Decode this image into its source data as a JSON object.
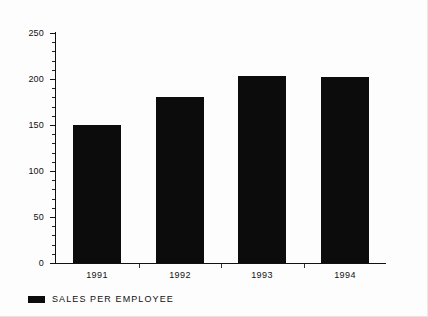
{
  "chart_data": {
    "type": "bar",
    "title": "",
    "subtitle": "",
    "xlabel": "",
    "ylabel": "",
    "categories": [
      "1991",
      "1992",
      "1993",
      "1994"
    ],
    "values": [
      150,
      180,
      203,
      202
    ],
    "series": [
      {
        "name": "SALES PER EMPLOYEE",
        "values": [
          150,
          180,
          203,
          202
        ],
        "color": "#0c0c0c"
      }
    ],
    "ylim": [
      0,
      250
    ],
    "ytick_labels": [
      "0",
      "50",
      "100",
      "150",
      "200",
      "250"
    ],
    "ytick_values": [
      0,
      50,
      100,
      150,
      200,
      250
    ],
    "yminor_step": 10,
    "grid": false,
    "legend": {
      "position": "bottom-left",
      "entries": [
        {
          "label": "SALES PER EMPLOYEE",
          "color": "#0c0c0c"
        }
      ]
    }
  },
  "legend": {
    "label": "SALES PER EMPLOYEE"
  }
}
